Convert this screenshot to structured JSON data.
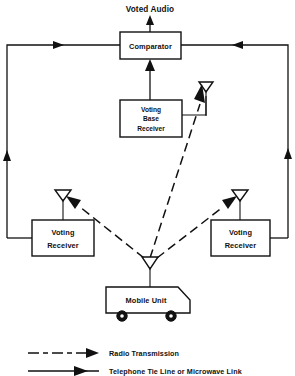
{
  "figure": {
    "title": "Voted Audio",
    "type": "block-diagram"
  },
  "nodes": {
    "comparator": {
      "label": "Comparator"
    },
    "voting_base_receiver": {
      "line1": "Voting",
      "line2": "Base",
      "line3": "Receiver"
    },
    "voting_receiver_left": {
      "line1": "Voting",
      "line2": "Receiver"
    },
    "voting_receiver_right": {
      "line1": "Voting",
      "line2": "Receiver"
    },
    "mobile_unit": {
      "label": "Mobile Unit"
    }
  },
  "legend": {
    "items": [
      {
        "style": "dashed-arrow",
        "label": "Radio Transmission"
      },
      {
        "style": "solid-arrow",
        "label": "Telephone Tie Line or Microwave Link"
      }
    ]
  },
  "icons": {
    "antenna_base": "antenna-icon",
    "antenna_left": "antenna-icon",
    "antenna_right": "antenna-icon",
    "antenna_mobile": "antenna-icon"
  },
  "colors": {
    "ink": "#111111",
    "paper": "#ffffff"
  }
}
